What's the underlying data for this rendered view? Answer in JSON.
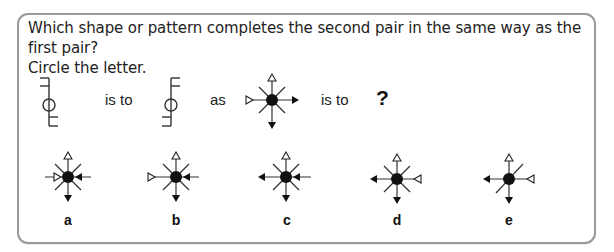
{
  "question": {
    "line1": "Which shape or pattern completes the second pair in the same way as the first pair?",
    "line2": "Circle the letter."
  },
  "analogy": {
    "is_to_1": "is to",
    "as": "as",
    "is_to_2": "is to",
    "unknown": "?"
  },
  "figures": {
    "pair1_first": "stem-circle-with-hooks-top-left-bottom-right",
    "pair1_second": "stem-circle-with-hooks-top-right-bottom-left",
    "pair2_first": "star-dot-open-arrow-left-in-filled-arrow-right-out"
  },
  "options": [
    {
      "label": "a",
      "shape": "star-dot-open-left-in-filled-right-in"
    },
    {
      "label": "b",
      "shape": "star-dot-open-left-in-filled-right-in-short"
    },
    {
      "label": "c",
      "shape": "star-dot-filled-left-out-filled-right-in"
    },
    {
      "label": "d",
      "shape": "star-dot-filled-left-out-open-right-in"
    },
    {
      "label": "e",
      "shape": "star-dot-filled-left-out-open-right-in-one-diagonal"
    }
  ],
  "colors": {
    "border": "#9a9a9a",
    "ink": "#111111",
    "line_gray": "#444444"
  }
}
